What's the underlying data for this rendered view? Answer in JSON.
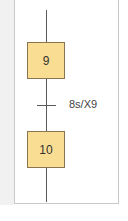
{
  "diagram": {
    "type": "grafcet",
    "steps": [
      {
        "id": "9",
        "label": "9"
      },
      {
        "id": "10",
        "label": "10"
      }
    ],
    "transitions": [
      {
        "from": "9",
        "to": "10",
        "condition": "8s/X9"
      }
    ],
    "colors": {
      "step_fill": "#f9dd92",
      "step_border": "#8a7550",
      "link_line": "#5a5a5a",
      "panel_border": "#c9c9c9"
    }
  },
  "footer": {
    "caption_partial": ""
  }
}
